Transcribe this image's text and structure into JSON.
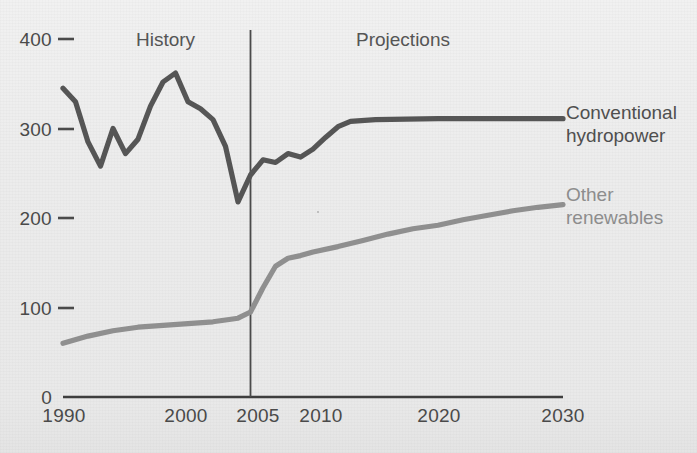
{
  "chart_data": {
    "type": "line",
    "title": "",
    "xlabel": "",
    "ylabel": "",
    "xlim": [
      1990,
      2030
    ],
    "ylim": [
      0,
      400
    ],
    "grid": false,
    "legend_position": "right-inline",
    "y_ticks": [
      "0",
      "100",
      "200",
      "300",
      "400"
    ],
    "y_tick_values": [
      0,
      100,
      200,
      300,
      400
    ],
    "x_ticks": [
      "1990",
      "2000",
      "2005",
      "2010",
      "2020",
      "2030"
    ],
    "x_tick_values": [
      1990,
      2000,
      2005,
      2010,
      2020,
      2030
    ],
    "annotations": [
      {
        "text": "History",
        "x": 1996
      },
      {
        "text": "Projections",
        "x": 2013
      }
    ],
    "divider_label": "2005",
    "divider_x": 2005,
    "series": [
      {
        "name": "Conventional hydropower",
        "label_line1": "Conventional",
        "label_line2": "hydropower",
        "color": "#555555",
        "x": [
          1990,
          1991,
          1992,
          1993,
          1994,
          1995,
          1996,
          1997,
          1998,
          1999,
          2000,
          2001,
          2002,
          2003,
          2004,
          2005,
          2006,
          2007,
          2008,
          2009,
          2010,
          2011,
          2012,
          2013,
          2015,
          2020,
          2025,
          2030
        ],
        "values": [
          345,
          330,
          285,
          258,
          300,
          272,
          288,
          325,
          352,
          362,
          330,
          322,
          310,
          280,
          218,
          248,
          265,
          262,
          272,
          268,
          277,
          290,
          302,
          308,
          310,
          311,
          311,
          311
        ]
      },
      {
        "name": "Other renewables",
        "label_line1": "Other",
        "label_line2": "renewables",
        "color": "#8f8f8f",
        "x": [
          1990,
          1992,
          1994,
          1996,
          1998,
          2000,
          2002,
          2004,
          2005,
          2006,
          2007,
          2008,
          2009,
          2010,
          2012,
          2014,
          2016,
          2018,
          2020,
          2022,
          2024,
          2026,
          2028,
          2030
        ],
        "values": [
          60,
          68,
          74,
          78,
          80,
          82,
          84,
          88,
          95,
          122,
          146,
          155,
          158,
          162,
          168,
          175,
          182,
          188,
          192,
          198,
          203,
          208,
          212,
          215
        ]
      }
    ]
  },
  "units_note": ""
}
